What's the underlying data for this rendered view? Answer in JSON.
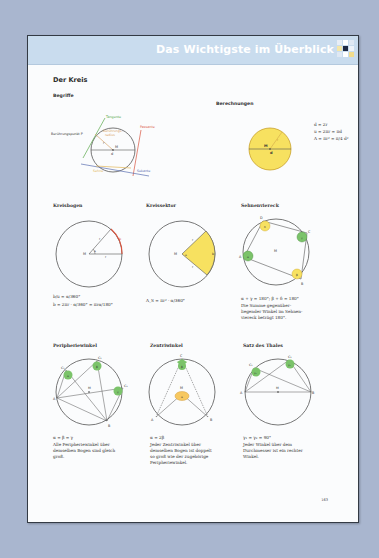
{
  "header": {
    "title": "Das Wichtigste im Überblick"
  },
  "section": {
    "title": "Der Kreis"
  },
  "begriffe": {
    "heading": "Begriffe",
    "labels": {
      "tangente": "Tangente",
      "passante": "Passante",
      "beruehrungspunkt": "Berührungspunkt P",
      "beruehrungsradius_1": "Berührungs-",
      "beruehrungsradius_2": "radius",
      "r": "r",
      "M": "M",
      "d": "d",
      "sehne": "Sehne",
      "sekante": "Sekante"
    },
    "colors": {
      "tangente": "#5aa94a",
      "passante": "#d9553f",
      "radius": "#d9a66b",
      "sehne": "#e2b85a",
      "sekante": "#5a6fb0"
    }
  },
  "berechnungen": {
    "heading": "Berechnungen",
    "labels": {
      "M": "M",
      "d": "d",
      "r": "r"
    },
    "formulas": [
      "d = 2r",
      "u = 2πr = πd",
      "A = πr² = π/4 d²"
    ],
    "fill_color": "#f7e160"
  },
  "kreisbogen": {
    "heading": "Kreisbogen",
    "labels": {
      "M": "M",
      "r1": "r",
      "r2": "r",
      "b": "b",
      "alpha": "α"
    },
    "formulas": [
      "b/u = α/360°",
      "b = 2πr · α/360° = πrα/180°"
    ]
  },
  "kreissektor": {
    "heading": "Kreissektor",
    "labels": {
      "M": "M",
      "r1": "r",
      "r2": "r",
      "b": "b",
      "alpha": "α"
    },
    "formulas": [
      "A_S = πr² · α/360°"
    ]
  },
  "sehnenviereck": {
    "heading": "Sehnenviereck",
    "labels": {
      "A": "A",
      "B": "B",
      "C": "C",
      "D": "D",
      "M": "M",
      "alpha": "α",
      "beta": "β",
      "gamma": "γ",
      "delta": "δ"
    },
    "formulas": [
      "α + γ = 180°; β + δ = 180°"
    ],
    "description": [
      "Die Summe gegenüber-",
      "liegender Winkel im Sehnen-",
      "viereck beträgt 180°."
    ]
  },
  "peripheriewinkel": {
    "heading": "Peripheriewinkel",
    "labels": {
      "A": "A",
      "B": "B",
      "C1": "C₁",
      "C2": "C₂",
      "C3": "C₃",
      "M": "M",
      "alpha": "α",
      "beta": "β",
      "gamma": "γ"
    },
    "formulas": [
      "α = β = γ"
    ],
    "description": [
      "Alle Peripheriewinkel über",
      "demselben Bogen sind gleich",
      "groß."
    ]
  },
  "zentriwinkel": {
    "heading": "Zentriwinkel",
    "labels": {
      "A": "A",
      "B": "B",
      "C": "C",
      "M": "M",
      "alpha": "α",
      "beta": "β"
    },
    "formulas": [
      "α = 2β"
    ],
    "description": [
      "Jeder Zentriwinkel über",
      "demselben Bogen ist doppelt",
      "so groß wie der zugehörige",
      "Peripheriewinkel."
    ]
  },
  "thales": {
    "heading": "Satz des Thales",
    "labels": {
      "A": "A",
      "B": "B",
      "C1": "C₁",
      "C2": "C₂",
      "M": "M",
      "g1": "γ₁",
      "g2": "γ₂"
    },
    "formulas": [
      "γ₁ = γ₂ = 90°"
    ],
    "description": [
      "Jeder Winkel über dem",
      "Durchmesser ist ein rechter",
      "Winkel."
    ]
  },
  "page_number": "163"
}
